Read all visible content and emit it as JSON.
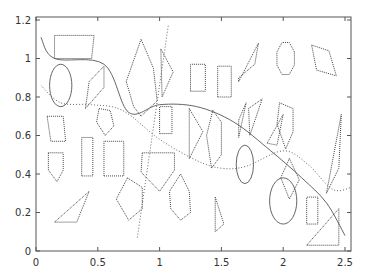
{
  "chart_data": {
    "type": "scatter",
    "title": "",
    "xlabel": "",
    "ylabel": "",
    "xlim": [
      0,
      2.5
    ],
    "ylim": [
      0,
      1.2
    ],
    "grid": false,
    "legend": null,
    "x_ticks": [
      "0",
      "0.5",
      "1",
      "1.5",
      "2",
      "2.5"
    ],
    "y_ticks": [
      "0",
      "0.2",
      "0.4",
      "0.6",
      "0.8",
      "1",
      "1.2"
    ],
    "polygons": [
      {
        "kind": "parallelogram",
        "points": [
          [
            0.15,
            1.0
          ],
          [
            0.45,
            1.0
          ],
          [
            0.47,
            1.12
          ],
          [
            0.15,
            1.12
          ]
        ]
      },
      {
        "kind": "ellipse",
        "center": [
          0.2,
          0.86
        ],
        "rx": 0.09,
        "ry": 0.11
      },
      {
        "kind": "quadrilateral",
        "points": [
          [
            0.4,
            0.74
          ],
          [
            0.55,
            0.85
          ],
          [
            0.55,
            0.96
          ],
          [
            0.43,
            0.88
          ]
        ]
      },
      {
        "kind": "hexagon",
        "points": [
          [
            0.73,
            0.88
          ],
          [
            0.85,
            1.1
          ],
          [
            0.95,
            0.95
          ],
          [
            0.98,
            0.78
          ],
          [
            0.85,
            0.7
          ],
          [
            0.79,
            0.75
          ]
        ]
      },
      {
        "kind": "triangle",
        "points": [
          [
            1.01,
            1.05
          ],
          [
            1.11,
            0.93
          ],
          [
            1.02,
            0.8
          ]
        ]
      },
      {
        "kind": "rectangle",
        "points": [
          [
            1.25,
            0.83
          ],
          [
            1.37,
            0.83
          ],
          [
            1.37,
            0.97
          ],
          [
            1.25,
            0.97
          ]
        ]
      },
      {
        "kind": "rectangle",
        "points": [
          [
            1.47,
            0.8
          ],
          [
            1.58,
            0.8
          ],
          [
            1.58,
            0.96
          ],
          [
            1.47,
            0.96
          ]
        ]
      },
      {
        "kind": "parallelogram",
        "points": [
          [
            1.64,
            0.88
          ],
          [
            1.8,
            1.08
          ],
          [
            1.77,
            0.97
          ],
          [
            1.64,
            0.9
          ]
        ]
      },
      {
        "kind": "octagon",
        "center": [
          2.02,
          1.0
        ],
        "r": 0.09
      },
      {
        "kind": "parallelogram",
        "points": [
          [
            2.23,
            1.07
          ],
          [
            2.37,
            1.04
          ],
          [
            2.43,
            0.91
          ],
          [
            2.27,
            0.94
          ]
        ]
      },
      {
        "kind": "quadrilateral",
        "points": [
          [
            0.09,
            0.7
          ],
          [
            0.22,
            0.7
          ],
          [
            0.24,
            0.57
          ],
          [
            0.12,
            0.57
          ]
        ]
      },
      {
        "kind": "pentagon",
        "points": [
          [
            0.51,
            0.74
          ],
          [
            0.6,
            0.73
          ],
          [
            0.63,
            0.65
          ],
          [
            0.56,
            0.6
          ],
          [
            0.49,
            0.67
          ]
        ]
      },
      {
        "kind": "rectangle",
        "points": [
          [
            1.0,
            0.61
          ],
          [
            1.1,
            0.61
          ],
          [
            1.1,
            0.75
          ],
          [
            1.0,
            0.75
          ]
        ]
      },
      {
        "kind": "triangle",
        "points": [
          [
            1.24,
            0.74
          ],
          [
            1.35,
            0.62
          ],
          [
            1.24,
            0.48
          ]
        ]
      },
      {
        "kind": "hexagon",
        "points": [
          [
            1.43,
            0.73
          ],
          [
            1.5,
            0.67
          ],
          [
            1.5,
            0.5
          ],
          [
            1.42,
            0.43
          ],
          [
            1.38,
            0.6
          ]
        ]
      },
      {
        "kind": "triangle",
        "points": [
          [
            1.64,
            0.68
          ],
          [
            1.7,
            0.77
          ],
          [
            1.64,
            0.59
          ]
        ]
      },
      {
        "kind": "triangle",
        "points": [
          [
            1.72,
            0.74
          ],
          [
            1.83,
            0.79
          ],
          [
            1.73,
            0.6
          ]
        ]
      },
      {
        "kind": "hexagon",
        "points": [
          [
            1.97,
            0.77
          ],
          [
            2.08,
            0.74
          ],
          [
            2.08,
            0.62
          ],
          [
            2.02,
            0.53
          ],
          [
            1.95,
            0.66
          ]
        ]
      },
      {
        "kind": "triangle",
        "points": [
          [
            1.87,
            0.56
          ],
          [
            2.0,
            0.71
          ],
          [
            1.95,
            0.55
          ]
        ]
      },
      {
        "kind": "triangle",
        "points": [
          [
            2.35,
            0.3
          ],
          [
            2.47,
            0.71
          ],
          [
            2.45,
            0.43
          ]
        ]
      },
      {
        "kind": "pentagon",
        "points": [
          [
            0.1,
            0.51
          ],
          [
            0.22,
            0.51
          ],
          [
            0.22,
            0.42
          ],
          [
            0.17,
            0.36
          ],
          [
            0.1,
            0.42
          ]
        ]
      },
      {
        "kind": "rectangle",
        "points": [
          [
            0.37,
            0.39
          ],
          [
            0.46,
            0.39
          ],
          [
            0.46,
            0.59
          ],
          [
            0.37,
            0.59
          ]
        ]
      },
      {
        "kind": "rectangle",
        "points": [
          [
            0.55,
            0.39
          ],
          [
            0.71,
            0.39
          ],
          [
            0.71,
            0.57
          ],
          [
            0.55,
            0.57
          ]
        ]
      },
      {
        "kind": "pentagon",
        "points": [
          [
            0.86,
            0.51
          ],
          [
            1.12,
            0.51
          ],
          [
            1.12,
            0.42
          ],
          [
            1.0,
            0.31
          ],
          [
            0.85,
            0.41
          ]
        ]
      },
      {
        "kind": "diamond",
        "points": [
          [
            2.05,
            0.48
          ],
          [
            2.13,
            0.37
          ],
          [
            2.05,
            0.27
          ],
          [
            1.98,
            0.38
          ]
        ]
      },
      {
        "kind": "ellipse",
        "center": [
          1.69,
          0.45
        ],
        "rx": 0.07,
        "ry": 0.1
      },
      {
        "kind": "hexagon",
        "points": [
          [
            0.74,
            0.38
          ],
          [
            0.86,
            0.33
          ],
          [
            0.86,
            0.22
          ],
          [
            0.75,
            0.16
          ],
          [
            0.65,
            0.27
          ]
        ]
      },
      {
        "kind": "hexagon",
        "points": [
          [
            1.17,
            0.4
          ],
          [
            1.24,
            0.31
          ],
          [
            1.25,
            0.2
          ],
          [
            1.17,
            0.16
          ],
          [
            1.09,
            0.22
          ],
          [
            1.08,
            0.31
          ]
        ]
      },
      {
        "kind": "triangle",
        "points": [
          [
            1.45,
            0.28
          ],
          [
            1.52,
            0.14
          ],
          [
            1.45,
            0.1
          ]
        ]
      },
      {
        "kind": "ellipse",
        "center": [
          2.0,
          0.26
        ],
        "rx": 0.11,
        "ry": 0.12
      },
      {
        "kind": "rectangle",
        "points": [
          [
            2.19,
            0.14
          ],
          [
            2.28,
            0.14
          ],
          [
            2.28,
            0.28
          ],
          [
            2.19,
            0.28
          ]
        ]
      },
      {
        "kind": "triangle",
        "points": [
          [
            0.15,
            0.15
          ],
          [
            0.33,
            0.15
          ],
          [
            0.43,
            0.31
          ]
        ]
      },
      {
        "kind": "triangle",
        "points": [
          [
            2.19,
            0.03
          ],
          [
            2.45,
            0.03
          ],
          [
            2.45,
            0.22
          ]
        ]
      }
    ],
    "lines": [
      {
        "name": "solid-curve",
        "style": "solid",
        "x": [
          0.04,
          0.15,
          0.55,
          0.75,
          1.0,
          1.3,
          1.6,
          1.9,
          2.15,
          2.35,
          2.5
        ],
        "y": [
          1.11,
          1.0,
          0.97,
          0.72,
          0.76,
          0.75,
          0.67,
          0.52,
          0.38,
          0.25,
          0.08
        ]
      },
      {
        "name": "dotted-curve",
        "style": "dotted",
        "x": [
          0.04,
          0.2,
          0.45,
          0.7,
          1.0,
          1.3,
          1.5,
          1.7,
          2.0,
          2.2,
          2.4,
          2.55
        ],
        "y": [
          0.86,
          0.77,
          0.76,
          0.73,
          0.58,
          0.47,
          0.43,
          0.44,
          0.52,
          0.45,
          0.32,
          0.33
        ]
      },
      {
        "name": "dotted-steep-line",
        "style": "dotted",
        "x": [
          0.82,
          1.07
        ],
        "y": [
          0.07,
          1.17
        ]
      }
    ]
  }
}
